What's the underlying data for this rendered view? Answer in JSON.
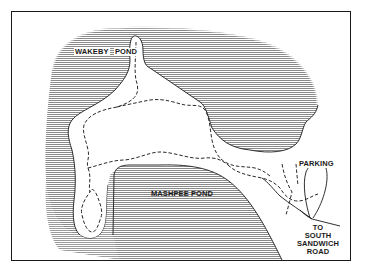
{
  "map": {
    "type": "trail-map",
    "colors": {
      "water_hatch": "#8a8a8a",
      "land": "#ffffff",
      "shoreline": "#1a1a1a",
      "trail": "#2a2a2a",
      "frame": "#1a1a1a"
    },
    "labels": {
      "wakeby_left": "WAKEBY",
      "wakeby_right": "POND",
      "mashpee": "MASHPEE POND",
      "parking": "PARKING",
      "road_line1": "TO",
      "road_line2": "SOUTH",
      "road_line3": "SANDWICH",
      "road_line4": "ROAD"
    },
    "features": {
      "water_bodies": [
        "Wakeby Pond",
        "Mashpee Pond"
      ],
      "trail_style": "dashed",
      "parking_loop": "teardrop loop road",
      "road": "To South Sandwich Road"
    }
  }
}
